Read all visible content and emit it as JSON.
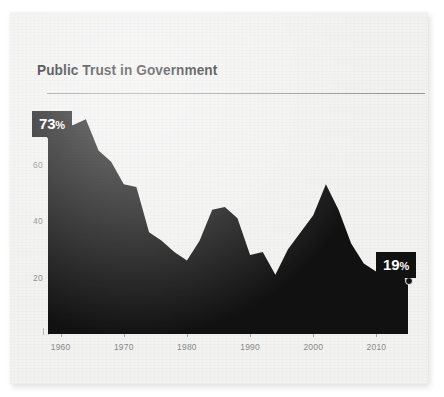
{
  "card": {
    "title": "Public Trust in Government"
  },
  "chart_data": {
    "type": "area",
    "title": "Public Trust in Government",
    "xlabel": "",
    "ylabel": "",
    "xlim": [
      1958,
      2015
    ],
    "ylim": [
      0,
      80
    ],
    "grid": false,
    "legend": null,
    "xticks": [
      "1960",
      "1970",
      "1980",
      "1990",
      "2000",
      "2010"
    ],
    "xtick_values": [
      1960,
      1970,
      1980,
      1990,
      2000,
      2010
    ],
    "yticks": [
      "20",
      "40",
      "60"
    ],
    "ytick_values": [
      20,
      40,
      60
    ],
    "annotations": [
      {
        "name": "start-callout",
        "label": "73",
        "suffix": "%",
        "x": 1958,
        "y": 73
      },
      {
        "name": "end-callout",
        "label": "19",
        "suffix": "%",
        "x": 2015,
        "y": 19
      }
    ],
    "x": [
      1958,
      1960,
      1962,
      1964,
      1966,
      1968,
      1970,
      1972,
      1974,
      1976,
      1978,
      1980,
      1982,
      1984,
      1986,
      1988,
      1990,
      1992,
      1994,
      1996,
      1998,
      2000,
      2002,
      2004,
      2006,
      2008,
      2010,
      2012,
      2015
    ],
    "values": [
      73,
      73,
      74,
      76,
      65,
      61,
      53,
      52,
      36,
      33,
      29,
      26,
      33,
      44,
      45,
      41,
      28,
      29,
      21,
      30,
      36,
      42,
      53,
      44,
      32,
      25,
      22,
      21,
      19
    ],
    "series": [
      {
        "name": "Public trust",
        "values": [
          73,
          73,
          74,
          76,
          65,
          61,
          53,
          52,
          36,
          33,
          29,
          26,
          33,
          44,
          45,
          41,
          28,
          29,
          21,
          30,
          36,
          42,
          53,
          44,
          32,
          25,
          22,
          21,
          19
        ]
      }
    ],
    "colors": {
      "area": "#111111",
      "background": "#f2f2f1",
      "tick_text": "#8a8a8a",
      "rule": "#9a9a9a",
      "badge_bg": "#111111",
      "badge_text": "#ffffff"
    }
  }
}
